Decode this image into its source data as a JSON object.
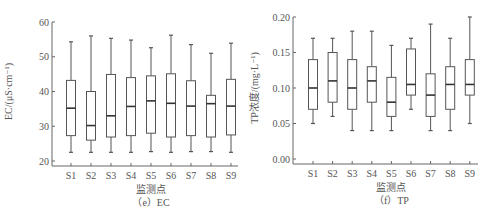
{
  "chart_data": [
    {
      "type": "box",
      "title": "（e）EC",
      "caption": "（e）EC",
      "xlabel": "监测点",
      "ylabel": "EC/(μS·cm⁻¹)",
      "ylim": [
        20,
        60
      ],
      "yticks": [
        20,
        30,
        40,
        50,
        60
      ],
      "ytick_labels": [
        "20",
        "30",
        "40",
        "50",
        "60"
      ],
      "grid": false,
      "legend": null,
      "categories": [
        "S1",
        "S2",
        "S3",
        "S4",
        "S5",
        "S6",
        "S7",
        "S8",
        "S9"
      ],
      "series": [
        {
          "name": "S1",
          "whisker_low": 22.5,
          "q1": 27.3,
          "median": 35.2,
          "q3": 43.2,
          "whisker_high": 54.3
        },
        {
          "name": "S2",
          "whisker_low": 22.5,
          "q1": 26.0,
          "median": 30.2,
          "q3": 40.0,
          "whisker_high": 56.0
        },
        {
          "name": "S3",
          "whisker_low": 22.5,
          "q1": 26.9,
          "median": 33.0,
          "q3": 44.9,
          "whisker_high": 55.3
        },
        {
          "name": "S4",
          "whisker_low": 22.5,
          "q1": 27.3,
          "median": 35.7,
          "q3": 44.0,
          "whisker_high": 54.8
        },
        {
          "name": "S5",
          "whisker_low": 22.7,
          "q1": 28.0,
          "median": 37.3,
          "q3": 44.5,
          "whisker_high": 52.6
        },
        {
          "name": "S6",
          "whisker_low": 22.5,
          "q1": 26.9,
          "median": 36.6,
          "q3": 45.1,
          "whisker_high": 56.2
        },
        {
          "name": "S7",
          "whisker_low": 22.7,
          "q1": 27.3,
          "median": 35.8,
          "q3": 43.1,
          "whisker_high": 53.5
        },
        {
          "name": "S8",
          "whisker_low": 22.7,
          "q1": 26.9,
          "median": 36.5,
          "q3": 38.9,
          "whisker_high": 51.0
        },
        {
          "name": "S9",
          "whisker_low": 22.5,
          "q1": 27.5,
          "median": 35.8,
          "q3": 43.5,
          "whisker_high": 53.9
        }
      ]
    },
    {
      "type": "box",
      "title": "（f）TP",
      "caption": "（f）TP",
      "xlabel": "监测点",
      "ylabel": "TP浓度/(mg·L⁻¹)",
      "ylim": [
        0.0,
        0.2
      ],
      "yticks": [
        0.0,
        0.05,
        0.1,
        0.15,
        0.2
      ],
      "ytick_labels": [
        "0.00",
        "0.05",
        "0.10",
        "0.15",
        "0.20"
      ],
      "grid": false,
      "legend": null,
      "categories": [
        "S1",
        "S2",
        "S3",
        "S4",
        "S5",
        "S6",
        "S7",
        "S8",
        "S9"
      ],
      "series": [
        {
          "name": "S1",
          "whisker_low": 0.05,
          "q1": 0.07,
          "median": 0.1,
          "q3": 0.14,
          "whisker_high": 0.17
        },
        {
          "name": "S2",
          "whisker_low": 0.06,
          "q1": 0.08,
          "median": 0.11,
          "q3": 0.15,
          "whisker_high": 0.17
        },
        {
          "name": "S3",
          "whisker_low": 0.04,
          "q1": 0.07,
          "median": 0.1,
          "q3": 0.14,
          "whisker_high": 0.18
        },
        {
          "name": "S4",
          "whisker_low": 0.04,
          "q1": 0.08,
          "median": 0.11,
          "q3": 0.13,
          "whisker_high": 0.18
        },
        {
          "name": "S5",
          "whisker_low": 0.04,
          "q1": 0.06,
          "median": 0.08,
          "q3": 0.115,
          "whisker_high": 0.16
        },
        {
          "name": "S6",
          "whisker_low": 0.07,
          "q1": 0.09,
          "median": 0.105,
          "q3": 0.155,
          "whisker_high": 0.17
        },
        {
          "name": "S7",
          "whisker_low": 0.04,
          "q1": 0.06,
          "median": 0.09,
          "q3": 0.12,
          "whisker_high": 0.19
        },
        {
          "name": "S8",
          "whisker_low": 0.04,
          "q1": 0.07,
          "median": 0.105,
          "q3": 0.13,
          "whisker_high": 0.17
        },
        {
          "name": "S9",
          "whisker_low": 0.05,
          "q1": 0.09,
          "median": 0.105,
          "q3": 0.14,
          "whisker_high": 0.2
        }
      ]
    }
  ],
  "layout": {
    "axis_color": "#666666",
    "box_color": "#555555",
    "median_color": "#333333",
    "panels": [
      {
        "x0": 52,
        "x_first": 71,
        "x_step": 20,
        "x_end": 238,
        "y_top": 22,
        "y_bottom": 161,
        "box_w": 9
      },
      {
        "x0": 293,
        "x_first": 313,
        "x_step": 19.6,
        "x_end": 478,
        "y_top": 17,
        "y_bottom": 159,
        "box_w": 9
      }
    ]
  }
}
